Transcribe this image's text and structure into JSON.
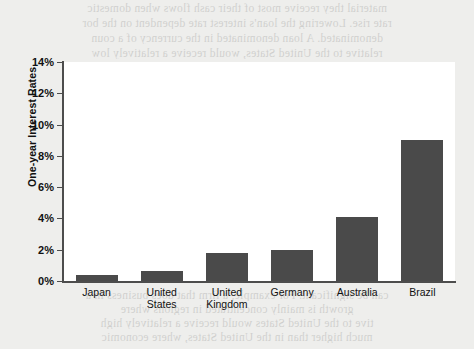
{
  "page": {
    "background_color": "#eeeeec",
    "bleed_through_text": [
      "material they receive most of their cash flows when domestic",
      "rate rise. Lowering the loan's interest rate dependent on the bor",
      "denominated. A loan denominated in the currency of a coun",
      "relative to the United States, would receive a relatively low"
    ],
    "bleed_through_text_lower": [
      "can be significant. For example, a firm that does business in a",
      "growth is mainly concentrated in regions where",
      "tive to the United States would receive a relatively high",
      "much higher than in the United States, where economic",
      "growth is weak. It can find it to have now high denominated"
    ]
  },
  "chart_data": {
    "type": "bar",
    "title": "",
    "subtitle": "",
    "xlabel": "",
    "ylabel": "One-year Interest Rates",
    "categories": [
      "Japan",
      "United States",
      "United Kingdom",
      "Germany",
      "Australia",
      "Brazil"
    ],
    "category_lines": [
      [
        "Japan"
      ],
      [
        "United",
        "States"
      ],
      [
        "United",
        "Kingdom"
      ],
      [
        "Germany"
      ],
      [
        "Australia"
      ],
      [
        "Brazil"
      ]
    ],
    "values": [
      0.4,
      0.65,
      1.8,
      2.0,
      4.1,
      9.0
    ],
    "value_unit": "%",
    "ylim": [
      0,
      14
    ],
    "ytick_values": [
      0,
      2,
      4,
      6,
      8,
      10,
      12,
      14
    ],
    "ytick_labels": [
      "0%",
      "2%",
      "4%",
      "6%",
      "8%",
      "10%",
      "12%",
      "14%"
    ],
    "grid": false,
    "legend": false,
    "bar_color": "#4a4a4a",
    "plot_background": "#ffffff",
    "axis_color": "#4d4d4d"
  }
}
